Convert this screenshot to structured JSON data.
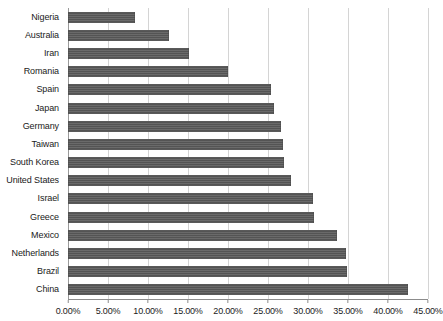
{
  "chart_data": {
    "type": "bar",
    "orientation": "horizontal",
    "title": "",
    "subtitle": "",
    "xlabel": "",
    "ylabel": "",
    "xlim": [
      0,
      45
    ],
    "value_format": "percent",
    "grid": true,
    "legend": false,
    "legend_position": "none",
    "bar_color": "#595959",
    "gridline_color": "#d4d4d4",
    "axis_color": "#8c8c8c",
    "categories": [
      "Nigeria",
      "Australia",
      "Iran",
      "Romania",
      "Spain",
      "Japan",
      "Germany",
      "Taiwan",
      "South Korea",
      "United States",
      "Israel",
      "Greece",
      "Mexico",
      "Netherlands",
      "Brazil",
      "China"
    ],
    "values": [
      8.4,
      12.6,
      15.1,
      20.0,
      25.4,
      25.8,
      26.6,
      26.9,
      27.0,
      27.9,
      30.6,
      30.8,
      33.6,
      34.8,
      34.9,
      42.5
    ],
    "xticks": [
      0,
      5,
      10,
      15,
      20,
      25,
      30,
      35,
      40,
      45
    ],
    "xtick_labels": [
      "0.00%",
      "5.00%",
      "10.00%",
      "15.00%",
      "20.00%",
      "25.00%",
      "30.00%",
      "35.00%",
      "40.00%",
      "45.00%"
    ]
  }
}
